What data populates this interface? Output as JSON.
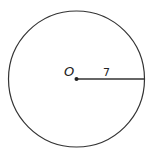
{
  "diagram": {
    "type": "circle",
    "center_label": "O",
    "radius_label": "7",
    "radius": 7,
    "stroke_color": "#333333",
    "background": "#ffffff"
  }
}
